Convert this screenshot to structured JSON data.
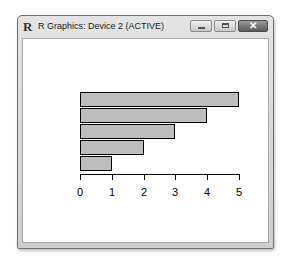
{
  "window": {
    "title": "R Graphics: Device 2 (ACTIVE)",
    "icon": "r-logo-icon",
    "controls": {
      "minimize": "minimize-icon",
      "maximize": "maximize-icon",
      "close": "close-icon",
      "close_glyph": "✕"
    }
  },
  "app_logo_text": "R",
  "chart_data": {
    "type": "bar",
    "orientation": "horizontal",
    "categories": [
      "1",
      "2",
      "3",
      "4",
      "5"
    ],
    "values": [
      1,
      2,
      3,
      4,
      5
    ],
    "title": "",
    "xlabel": "",
    "ylabel": "",
    "xlim": [
      0,
      5
    ],
    "xticks": [
      "0",
      "1",
      "2",
      "3",
      "4",
      "5"
    ],
    "bar_color": "#bebebe",
    "bar_border": "#000000",
    "grid": false,
    "legend": null
  }
}
